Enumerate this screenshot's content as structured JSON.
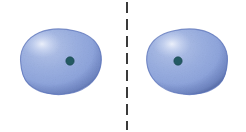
{
  "figure": {
    "title": "Two spherical atomic orbital lobes separated by a vertical dashed symmetry line",
    "canvas": {
      "width": 246,
      "height": 132,
      "background": "#ffffff"
    },
    "colors": {
      "lobe_highlight": "#d2dcf2",
      "lobe_light": "#a9bce4",
      "lobe_mid": "#7e97d4",
      "lobe_edge": "#5972b8",
      "lobe_shadow": "#4a63ab",
      "nucleus_dot": "#245a63",
      "nucleus_dot_edge": "#1b4650",
      "dashed_line": "#3a3a3a",
      "background": "#ffffff"
    },
    "dashed_line": {
      "label": "mirror-plane-dashed-line",
      "x": 127,
      "y_start": 2,
      "y_end": 130,
      "stroke_width": 2,
      "dash_length": 11,
      "gap_length": 6,
      "color": "#3a3a3a"
    },
    "lobes": [
      {
        "id": "left-lobe",
        "label": "left orbital lobe",
        "center_x": 60,
        "center_y": 62,
        "radius_x": 41,
        "radius_y": 33,
        "highlight_x": 42,
        "highlight_y": 44,
        "nucleus": {
          "label": "left nucleus dot",
          "cx": 70,
          "cy": 61,
          "r": 4.2
        }
      },
      {
        "id": "right-lobe",
        "label": "right orbital lobe",
        "center_x": 189,
        "center_y": 62,
        "radius_x": 39,
        "radius_y": 33,
        "highlight_x": 172,
        "highlight_y": 44,
        "nucleus": {
          "label": "right nucleus dot",
          "cx": 178,
          "cy": 61,
          "r": 4.2
        }
      }
    ]
  }
}
